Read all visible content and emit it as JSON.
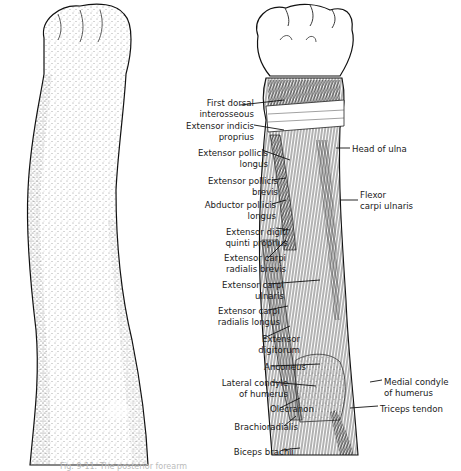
{
  "figure": {
    "left_panel": "surface-view-forearm",
    "right_panel": "muscles-forearm-posterior",
    "caption": "Fig. 9-11. The posterior forearm"
  },
  "labels_left": [
    {
      "id": "first-dorsal-interosseous",
      "lines": [
        "First dorsal",
        "interosseous"
      ],
      "x": 176,
      "y": 98
    },
    {
      "id": "extensor-indicis-proprius",
      "lines": [
        "Extensor indicis",
        "proprius"
      ],
      "x": 176,
      "y": 121
    },
    {
      "id": "extensor-pollicis-longus",
      "lines": [
        "Extensor pollicis",
        "longus"
      ],
      "x": 190,
      "y": 148
    },
    {
      "id": "extensor-pollicis-brevis",
      "lines": [
        "Extensor pollicis",
        "brevis"
      ],
      "x": 200,
      "y": 176
    },
    {
      "id": "abductor-pollicis-longus",
      "lines": [
        "Abductor pollicis",
        "longus"
      ],
      "x": 198,
      "y": 200
    },
    {
      "id": "extensor-digiti-quinti-proprius",
      "lines": [
        "Extensor digiti",
        "quinti proprius"
      ],
      "x": 210,
      "y": 227
    },
    {
      "id": "extensor-carpi-radialis-brevis",
      "lines": [
        "Extensor carpi",
        "radialis brevis"
      ],
      "x": 208,
      "y": 253
    },
    {
      "id": "extensor-carpi-ulnaris",
      "lines": [
        "Extensor carpi",
        "ulnaris"
      ],
      "x": 206,
      "y": 280
    },
    {
      "id": "extensor-carpi-radialis-longus",
      "lines": [
        "Extensor carpi",
        "radialis longus"
      ],
      "x": 202,
      "y": 306
    },
    {
      "id": "extensor-digitorum",
      "lines": [
        "Extensor",
        "digitorum"
      ],
      "x": 222,
      "y": 334
    },
    {
      "id": "anconeus",
      "lines": [
        "Anconeus"
      ],
      "x": 228,
      "y": 362
    },
    {
      "id": "lateral-condyle-of-humerus",
      "lines": [
        "Lateral condyle",
        "of humerus"
      ],
      "x": 210,
      "y": 378
    },
    {
      "id": "olecranon",
      "lines": [
        "Olecranon"
      ],
      "x": 236,
      "y": 404
    },
    {
      "id": "brachioradialis",
      "lines": [
        "Brachioradialis"
      ],
      "x": 220,
      "y": 422
    },
    {
      "id": "biceps-brachii",
      "lines": [
        "Biceps brachii"
      ],
      "x": 216,
      "y": 447
    }
  ],
  "labels_right": [
    {
      "id": "head-of-ulna",
      "lines": [
        "Head of ulna"
      ],
      "x": 352,
      "y": 144
    },
    {
      "id": "flexor-carpi-ulnaris",
      "lines": [
        "Flexor",
        "carpi ulnaris"
      ],
      "x": 360,
      "y": 190
    },
    {
      "id": "medial-condyle-of-humerus",
      "lines": [
        "Medial condyle",
        "of humerus"
      ],
      "x": 384,
      "y": 377
    },
    {
      "id": "triceps-tendon",
      "lines": [
        "Triceps tendon"
      ],
      "x": 380,
      "y": 404
    }
  ]
}
